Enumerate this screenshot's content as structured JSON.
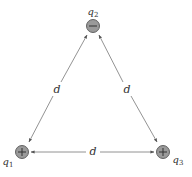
{
  "diagram": {
    "colors": {
      "line": "#777777",
      "charge_fill": "#9a9a9a",
      "charge_stroke": "#555555",
      "text": "#333333"
    },
    "charges": [
      {
        "id": "q1",
        "symbol": "q",
        "subscript": "1",
        "sign": "+",
        "x": 22,
        "y": 152
      },
      {
        "id": "q2",
        "symbol": "q",
        "subscript": "2",
        "sign": "−",
        "x": 93,
        "y": 26
      },
      {
        "id": "q3",
        "symbol": "q",
        "subscript": "3",
        "sign": "+",
        "x": 163,
        "y": 152
      }
    ],
    "distances": [
      {
        "between": [
          "q1",
          "q2"
        ],
        "label": "d"
      },
      {
        "between": [
          "q2",
          "q3"
        ],
        "label": "d"
      },
      {
        "between": [
          "q1",
          "q3"
        ],
        "label": "d"
      }
    ]
  }
}
